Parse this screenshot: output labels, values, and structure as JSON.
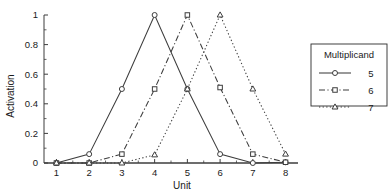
{
  "chart_data": {
    "type": "line",
    "title": "",
    "xlabel": "Unit",
    "ylabel": "Activation",
    "x": [
      1,
      2,
      3,
      4,
      5,
      6,
      7,
      8
    ],
    "xlim": [
      0.62,
      8.38
    ],
    "ylim": [
      0,
      1
    ],
    "xticks": [
      "1",
      "2",
      "3",
      "4",
      "5",
      "6",
      "7",
      "8"
    ],
    "yticks": [
      "0",
      "0.2",
      "0.4",
      "0.6",
      "0.8",
      "1"
    ],
    "ytick_values": [
      0,
      0.2,
      0.4,
      0.6,
      0.8,
      1
    ],
    "grid": false,
    "minor_ticks": true,
    "legend_title": "Multiplicand",
    "legend_position": "right",
    "series": [
      {
        "name": "5",
        "label": "5",
        "marker": "circle",
        "linestyle": "solid",
        "color": "#3d3d3d",
        "values": [
          0.0,
          0.06,
          0.5,
          1.0,
          0.5,
          0.06,
          0.0,
          0.005
        ]
      },
      {
        "name": "6",
        "label": "6",
        "marker": "square",
        "linestyle": "dashdot",
        "color": "#3d3d3d",
        "values": [
          0.0,
          0.0,
          0.06,
          0.5,
          1.0,
          0.51,
          0.06,
          0.005
        ]
      },
      {
        "name": "7",
        "label": "7",
        "marker": "triangle",
        "linestyle": "dotted",
        "color": "#3d3d3d",
        "values": [
          0.0,
          0.0,
          0.0,
          0.055,
          0.5,
          1.0,
          0.5,
          0.06
        ]
      }
    ]
  },
  "axes": {
    "x_title": "Unit",
    "y_title": "Activation"
  },
  "legend": {
    "title": "Multiplicand",
    "entries": [
      {
        "label": "5"
      },
      {
        "label": "6"
      },
      {
        "label": "7"
      }
    ]
  }
}
